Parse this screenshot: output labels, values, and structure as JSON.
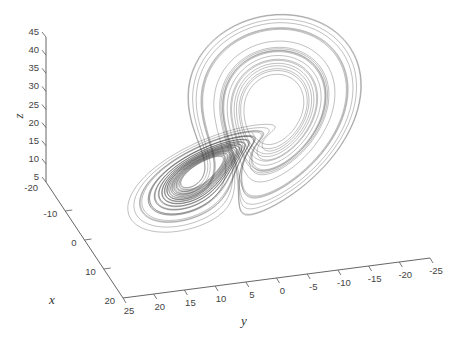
{
  "chart_data": {
    "type": "line",
    "subtype": "3d-trajectory",
    "title": "",
    "series": [
      {
        "name": "Lorenz trajectory",
        "system": "lorenz",
        "sigma": 10,
        "rho": 28,
        "beta": 2.6667,
        "color": "#2a2a2a"
      }
    ],
    "axes": {
      "x": {
        "label": "x",
        "lim": [
          -20,
          20
        ],
        "ticks": [
          "-20",
          "-10",
          "0",
          "10",
          "20"
        ]
      },
      "y": {
        "label": "y",
        "lim": [
          -25,
          25
        ],
        "ticks": [
          "25",
          "20",
          "15",
          "10",
          "5",
          "0",
          "-5",
          "-10",
          "-15",
          "-20",
          "-25"
        ]
      },
      "z": {
        "label": "z",
        "lim": [
          5,
          45
        ],
        "ticks": [
          "5",
          "10",
          "15",
          "20",
          "25",
          "30",
          "35",
          "40",
          "45"
        ]
      }
    },
    "grid": false,
    "legend": "none"
  }
}
